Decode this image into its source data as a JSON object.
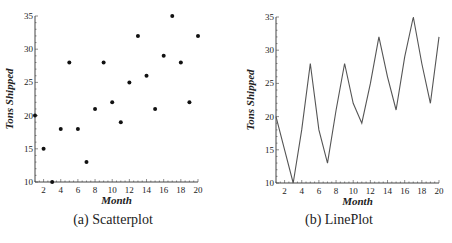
{
  "chart_data": [
    {
      "type": "scatter",
      "title": "",
      "caption": "(a) Scatterplot",
      "xlabel": "Month",
      "ylabel": "Tons Shipped",
      "xlim": [
        1,
        20
      ],
      "ylim": [
        10,
        35
      ],
      "xticks": [
        2,
        4,
        6,
        8,
        10,
        12,
        14,
        16,
        18,
        20
      ],
      "yticks": [
        10,
        15,
        20,
        25,
        30,
        35
      ],
      "grid": false,
      "x": [
        1,
        2,
        3,
        4,
        5,
        6,
        7,
        8,
        9,
        10,
        11,
        12,
        13,
        14,
        15,
        16,
        17,
        18,
        19,
        20
      ],
      "y": [
        20,
        15,
        10,
        18,
        28,
        18,
        13,
        21,
        28,
        22,
        19,
        25,
        32,
        26,
        21,
        29,
        35,
        28,
        22,
        32
      ],
      "color": "#111111"
    },
    {
      "type": "line",
      "title": "",
      "caption": "(b) LinePlot",
      "xlabel": "Month",
      "ylabel": "Tons Shipped",
      "xlim": [
        1,
        20
      ],
      "ylim": [
        10,
        35
      ],
      "xticks": [
        2,
        4,
        6,
        8,
        10,
        12,
        14,
        16,
        18,
        20
      ],
      "yticks": [
        10,
        15,
        20,
        25,
        30,
        35
      ],
      "grid": false,
      "x": [
        1,
        2,
        3,
        4,
        5,
        6,
        7,
        8,
        9,
        10,
        11,
        12,
        13,
        14,
        15,
        16,
        17,
        18,
        19,
        20
      ],
      "y": [
        20,
        15,
        10,
        18,
        28,
        18,
        13,
        21,
        28,
        22,
        19,
        25,
        32,
        26,
        21,
        29,
        35,
        28,
        22,
        32
      ],
      "color": "#555555"
    }
  ],
  "captions": {
    "a": "(a) Scatterplot",
    "b": "(b) LinePlot"
  }
}
